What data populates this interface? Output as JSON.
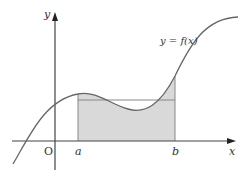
{
  "diagram": {
    "axes": {
      "x_label": "x",
      "y_label": "y",
      "origin_label": "O"
    },
    "curve_label": "y = f(x)",
    "points": {
      "a_label": "a",
      "b_label": "b"
    },
    "colors": {
      "axis": "#444444",
      "curve": "#666666",
      "shade": "#d9d9d9",
      "rect_line": "#888888"
    }
  }
}
